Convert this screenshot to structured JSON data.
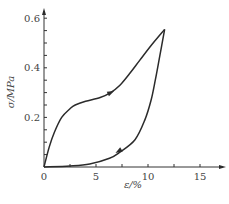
{
  "chart_data": {
    "type": "line",
    "title": "",
    "xlabel": "ε/%",
    "ylabel": "σ/MPa",
    "xlim": [
      0,
      17
    ],
    "ylim": [
      0,
      0.6
    ],
    "grid": false,
    "legend": null,
    "x_ticks": [
      0,
      5,
      10,
      15
    ],
    "x_tick_labels": [
      "0",
      "5",
      "10",
      "15"
    ],
    "x_minor_ticks": [
      2.5,
      7.5,
      12.5
    ],
    "y_ticks": [
      0.2,
      0.4,
      0.6
    ],
    "y_tick_labels": [
      "0.2",
      "0.4",
      "0.6"
    ],
    "y_minor_ticks": [
      0.05,
      0.1,
      0.15,
      0.25,
      0.3,
      0.35,
      0.45,
      0.5,
      0.55
    ],
    "origin_label": "0",
    "series": [
      {
        "name": "loading",
        "direction_arrow_at": {
          "x": 6.4,
          "y": 0.3
        },
        "x": [
          0,
          0.5,
          1.0,
          1.7,
          2.5,
          3.0,
          4.0,
          5.4,
          6.4,
          7.3,
          8.2,
          9.2,
          10.3,
          11.6
        ],
        "y": [
          0,
          0.08,
          0.14,
          0.2,
          0.235,
          0.25,
          0.265,
          0.28,
          0.3,
          0.33,
          0.375,
          0.43,
          0.49,
          0.555
        ]
      },
      {
        "name": "unloading",
        "direction_arrow_at": {
          "x": 7.2,
          "y": 0.065
        },
        "x": [
          11.6,
          11.1,
          10.7,
          10.3,
          9.7,
          8.75,
          7.3,
          6.3,
          4.4,
          2.5,
          0
        ],
        "y": [
          0.555,
          0.44,
          0.35,
          0.27,
          0.19,
          0.11,
          0.06,
          0.035,
          0.012,
          0.004,
          0
        ]
      }
    ]
  },
  "layout": {
    "origin_px": [
      44,
      167
    ],
    "px_per_x_unit": 10.4,
    "px_per_y_unit": 248,
    "x_axis_end_px": 223,
    "y_axis_top_px": 11
  }
}
